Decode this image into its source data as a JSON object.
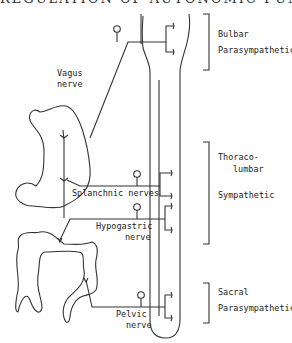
{
  "title": "REGULATION OF AUTONOMIC FUNCTIONS",
  "labels": {
    "vagus_line1": "Vagus",
    "vagus_line2": "nerve",
    "splanchnic": "Splanchnic nerves",
    "hypogastric_line1": "Hypogastric",
    "hypogastric_line2": "nerve",
    "pelvic_line1": "Pelvic",
    "pelvic_line2": "nerve"
  },
  "divisions": {
    "bulbar_line1": "Bulbar",
    "bulbar_line2": "Parasympathetic",
    "thoraco_line1": "Thoraco-",
    "thoraco_line2": "lumbar",
    "sympathetic": "Sympathetic",
    "sacral_line1": "Sacral",
    "sacral_line2": "Parasympathetic"
  },
  "colors": {
    "ink": "#333333",
    "background": "#ffffff"
  }
}
